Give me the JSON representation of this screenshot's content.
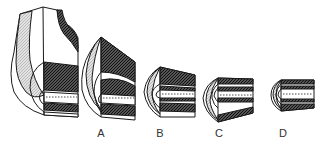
{
  "figure": {
    "stages": [
      {
        "id": "stage-0",
        "label": ""
      },
      {
        "id": "stage-a",
        "label": "A"
      },
      {
        "id": "stage-b",
        "label": "B"
      },
      {
        "id": "stage-c",
        "label": "C"
      },
      {
        "id": "stage-d",
        "label": "D"
      }
    ]
  },
  "colors": {
    "line": "#1a1a1a",
    "dark_hatch": "#3a3a3a",
    "light_hatch": "#c8c8c8",
    "background": "#ffffff"
  }
}
